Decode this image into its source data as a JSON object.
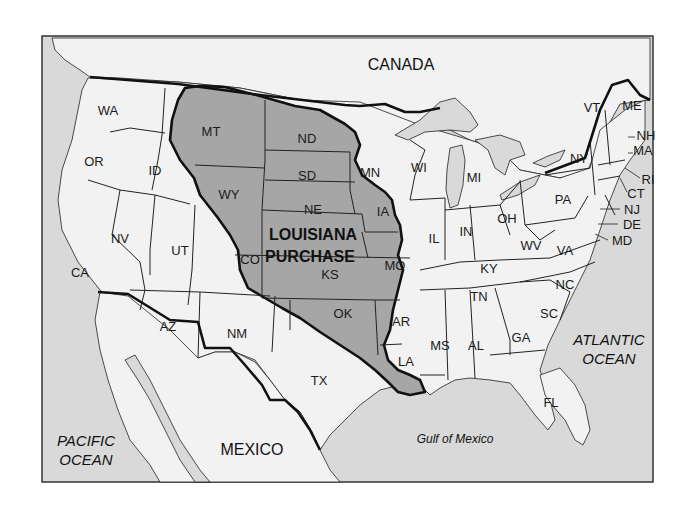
{
  "map": {
    "title_region": "LOUISIANA PURCHASE",
    "title_lines": [
      "LOUISIANA",
      "PURCHASE"
    ],
    "countries": {
      "canada": "CANADA",
      "mexico": "MEXICO"
    },
    "water": {
      "pacific": [
        "PACIFIC",
        "OCEAN"
      ],
      "atlantic": [
        "ATLANTIC",
        "OCEAN"
      ],
      "gulf": "Gulf of Mexico"
    },
    "colors": {
      "water": "#d9d9d9",
      "land": "#f2f2f2",
      "purchase": "#a6a6a6",
      "lakes": "#d9d9d9",
      "border": "#111111"
    },
    "purchase_states": [
      "MT",
      "ND",
      "SD",
      "WY",
      "NE",
      "CO",
      "KS",
      "MN",
      "IA",
      "MO",
      "OK",
      "AR",
      "LA"
    ],
    "states": {
      "WA": "WA",
      "OR": "OR",
      "ID": "ID",
      "MT": "MT",
      "ND": "ND",
      "SD": "SD",
      "WY": "WY",
      "NE": "NE",
      "NV": "NV",
      "UT": "UT",
      "CO": "CO",
      "KS": "KS",
      "CA": "CA",
      "AZ": "AZ",
      "NM": "NM",
      "TX": "TX",
      "OK": "OK",
      "MN": "MN",
      "IA": "IA",
      "MO": "MO",
      "AR": "AR",
      "LA": "LA",
      "WI": "WI",
      "IL": "IL",
      "MI": "MI",
      "IN": "IN",
      "OH": "OH",
      "KY": "KY",
      "TN": "TN",
      "MS": "MS",
      "AL": "AL",
      "GA": "GA",
      "FL": "FL",
      "SC": "SC",
      "NC": "NC",
      "VA": "VA",
      "WV": "WV",
      "PA": "PA",
      "NY": "NY",
      "VT": "VT",
      "ME": "ME",
      "NH": "NH",
      "MA": "MA",
      "RI": "RI",
      "CT": "CT",
      "NJ": "NJ",
      "DE": "DE",
      "MD": "MD"
    }
  }
}
